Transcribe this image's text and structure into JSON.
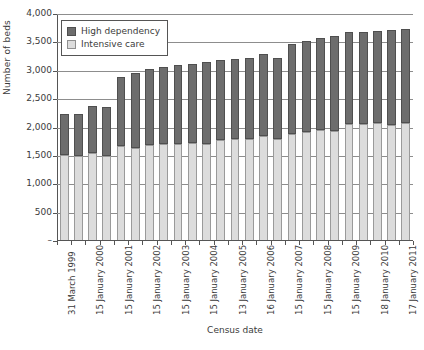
{
  "chart_data": {
    "type": "bar",
    "stacked": true,
    "title": "",
    "xlabel": "Census date",
    "ylabel": "Number of beds",
    "ylim": [
      0,
      4000
    ],
    "ytick_labels": [
      "4,000",
      "3,500",
      "3,000",
      "2,500",
      "2,000",
      "1,500",
      "1,000",
      "500",
      "–"
    ],
    "ytick_values": [
      4000,
      3500,
      3000,
      2500,
      2000,
      1500,
      1000,
      500,
      0
    ],
    "grid": true,
    "legend_position": "top-left",
    "categories": [
      "31 March 1999",
      "",
      "15 January 2000",
      "",
      "15 January 2001",
      "",
      "15 January 2002",
      "",
      "15 January 2003",
      "",
      "15 January 2004",
      "",
      "13 January 2005",
      "",
      "16 January 2006",
      "",
      "15 January 2007",
      "",
      "15 January 2008",
      "",
      "15 January 2009",
      "",
      "18 January 2010",
      "",
      "17 January 2011"
    ],
    "tick_labels": [
      "31 March 1999",
      "15 January 2000",
      "15 January 2001",
      "15 January 2002",
      "15 January 2003",
      "15 January 2004",
      "13 January 2005",
      "16 January 2006",
      "15 January 2007",
      "15 January 2008",
      "15 January 2009",
      "18 January 2010",
      "17 January 2011"
    ],
    "series": [
      {
        "name": "Intensive care",
        "color": "#dcdcdc",
        "values": [
          1510,
          1500,
          1555,
          1500,
          1675,
          1645,
          1700,
          1705,
          1710,
          1730,
          1705,
          1775,
          1800,
          1800,
          1845,
          1805,
          1880,
          1925,
          1960,
          1935,
          2070,
          2060,
          2080,
          2050,
          2080
        ]
      },
      {
        "name": "High dependency",
        "color": "#6d6d6d",
        "values": [
          730,
          740,
          825,
          860,
          1215,
          1315,
          1330,
          1360,
          1400,
          1395,
          1450,
          1410,
          1405,
          1425,
          1445,
          1420,
          1600,
          1595,
          1620,
          1680,
          1615,
          1625,
          1620,
          1660,
          1650
        ]
      }
    ],
    "totals": [
      2240,
      2240,
      2380,
      2360,
      2890,
      2960,
      3030,
      3065,
      3110,
      3125,
      3155,
      3185,
      3205,
      3225,
      3290,
      3225,
      3480,
      3520,
      3580,
      3615,
      3685,
      3685,
      3700,
      3710,
      3730
    ]
  },
  "legend": {
    "items": [
      {
        "label": "High dependency",
        "swatch": "high-dependency-swatch"
      },
      {
        "label": "Intensive care",
        "swatch": "intensive-care-swatch"
      }
    ]
  }
}
